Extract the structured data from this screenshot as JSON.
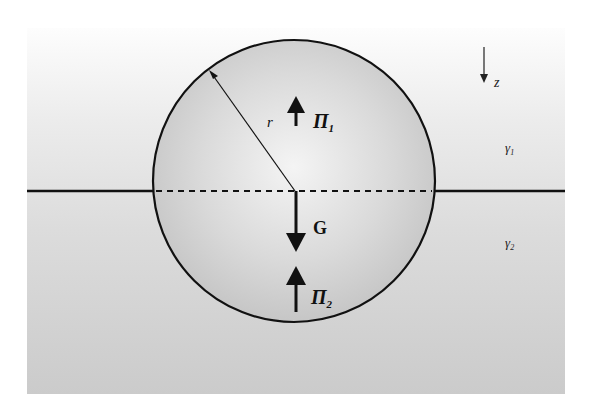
{
  "diagram": {
    "type": "physics-free-body",
    "colors": {
      "background": "#ffffff",
      "panel_top": "#fbfbfb",
      "panel_bottom": "#cdcdcd",
      "sphere_fill_edge": "#c8c8c8",
      "sphere_fill_center": "#f2f2f2",
      "stroke": "#111111"
    },
    "labels": {
      "radius": "r",
      "pressure_top": "Π",
      "pressure_top_sub": "1",
      "gravity": "G",
      "pressure_bottom": "Π",
      "pressure_bottom_sub": "2",
      "axis": "z",
      "fluid_top": "γ",
      "fluid_top_sub": "1",
      "fluid_bottom": "γ",
      "fluid_bottom_sub": "2"
    },
    "elements": [
      {
        "name": "interface-line",
        "style": "solid, dashed inside sphere"
      },
      {
        "name": "sphere",
        "radius_label": "r"
      },
      {
        "name": "force-arrow-pi1",
        "direction": "up",
        "label": "Π1"
      },
      {
        "name": "force-arrow-g",
        "direction": "down",
        "label": "G"
      },
      {
        "name": "force-arrow-pi2",
        "direction": "up",
        "label": "Π2"
      },
      {
        "name": "z-axis-arrow",
        "direction": "down",
        "label": "z"
      }
    ]
  }
}
